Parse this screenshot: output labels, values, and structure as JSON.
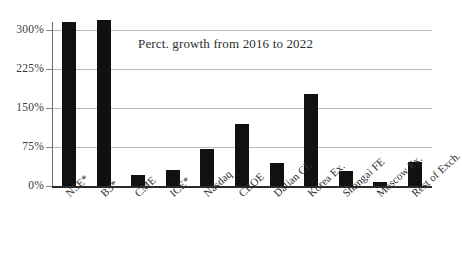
{
  "chart_data": {
    "type": "bar",
    "title": "Perct. growth from 2016 to 2022",
    "xlabel": "",
    "ylabel": "",
    "ylim": [
      0,
      315
    ],
    "ytick_values": [
      0,
      75,
      150,
      225,
      300
    ],
    "ytick_labels": [
      "0%",
      "75%",
      "150%",
      "225%",
      "300%"
    ],
    "grid": true,
    "legend": "none",
    "bar_color": "#111111",
    "gridline_color": "#b9b9b9",
    "axis_color": "#2b2b2b",
    "categories": [
      "NSE*",
      "B3*",
      "CME",
      "ICE*",
      "Nasdaq",
      "CBOE",
      "Dalian CE",
      "Korea Ex.",
      "Shangai FE",
      "Moscow Ex.",
      "Rest of Exch."
    ],
    "values": [
      315,
      319,
      21,
      31,
      72,
      120,
      44,
      177,
      29,
      8,
      47
    ]
  }
}
